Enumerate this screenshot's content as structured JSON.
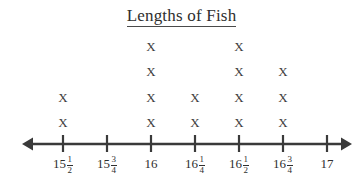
{
  "chart_data": {
    "type": "line-plot",
    "title": "Lengths of Fish",
    "xlabel": "",
    "ylabel": "",
    "grid": false,
    "legend": false,
    "axis": {
      "style": "number-line",
      "left_arrow": true,
      "right_arrow": true,
      "tick_count": 7
    },
    "mark_symbol": "X",
    "categories": [
      "15 1/2",
      "15 3/4",
      "16",
      "16 1/4",
      "16 1/2",
      "16 3/4",
      "17"
    ],
    "values": [
      2,
      0,
      4,
      2,
      4,
      3,
      0
    ],
    "points": [
      {
        "label": "15 1/2",
        "whole": "15",
        "numerator": "1",
        "denominator": "2",
        "count": 2
      },
      {
        "label": "15 3/4",
        "whole": "15",
        "numerator": "3",
        "denominator": "4",
        "count": 0
      },
      {
        "label": "16",
        "whole": "16",
        "numerator": "",
        "denominator": "",
        "count": 4
      },
      {
        "label": "16 1/4",
        "whole": "16",
        "numerator": "1",
        "denominator": "4",
        "count": 2
      },
      {
        "label": "16 1/2",
        "whole": "16",
        "numerator": "1",
        "denominator": "2",
        "count": 4
      },
      {
        "label": "16 3/4",
        "whole": "16",
        "numerator": "3",
        "denominator": "4",
        "count": 3
      },
      {
        "label": "17",
        "whole": "17",
        "numerator": "",
        "denominator": "",
        "count": 0
      }
    ]
  },
  "colors": {
    "background": "#ffffff",
    "axis": "#3a3a3a",
    "text": "#2f2f2f",
    "mark": "#3d3d3d"
  },
  "layout": {
    "tick_x": [
      63,
      107,
      151,
      195,
      239,
      283,
      327
    ],
    "row_y": [
      46,
      71,
      97,
      122
    ],
    "axis_y": 144,
    "arrow_left_x": 22,
    "arrow_right_x": 352
  }
}
